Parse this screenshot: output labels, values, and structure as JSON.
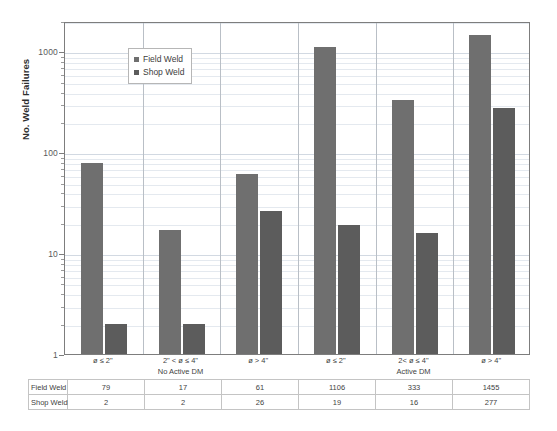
{
  "chart_data": {
    "type": "bar",
    "title": "",
    "xlabel": "",
    "ylabel": "No. Weld Failures",
    "yscale": "log",
    "ylim": [
      1,
      2000
    ],
    "ytick_labels": [
      "1",
      "10",
      "100",
      "1000"
    ],
    "ytick_values": [
      1,
      10,
      100,
      1000
    ],
    "grid": true,
    "legend_position": "upper-left-inside",
    "categories": [
      "ø ≤ 2\"",
      "2\" < ø ≤ 4\"",
      "ø > 4\"",
      "ø ≤ 2\"",
      "2< ø ≤ 4\"",
      "ø > 4\""
    ],
    "group_labels": [
      "No Active DM",
      "Active DM"
    ],
    "series": [
      {
        "name": "Field Weld",
        "color": "#6f6f6f",
        "values": [
          79,
          17,
          61,
          1106,
          333,
          1455
        ]
      },
      {
        "name": "Shop Weld",
        "color": "#5c5c5c",
        "values": [
          2,
          2,
          26,
          19,
          16,
          277
        ]
      }
    ]
  },
  "legend": {
    "items": [
      {
        "label": "Field Weld"
      },
      {
        "label": "Shop Weld"
      }
    ]
  },
  "table": {
    "rows": [
      {
        "header": "Field Weld",
        "values": [
          "79",
          "17",
          "61",
          "1106",
          "333",
          "1455"
        ]
      },
      {
        "header": "Shop Weld",
        "values": [
          "2",
          "2",
          "26",
          "19",
          "16",
          "277"
        ]
      }
    ]
  },
  "axis": {
    "y_title": "No. Weld Failures",
    "y_ticks": [
      "1000",
      "100",
      "10",
      "1"
    ]
  }
}
